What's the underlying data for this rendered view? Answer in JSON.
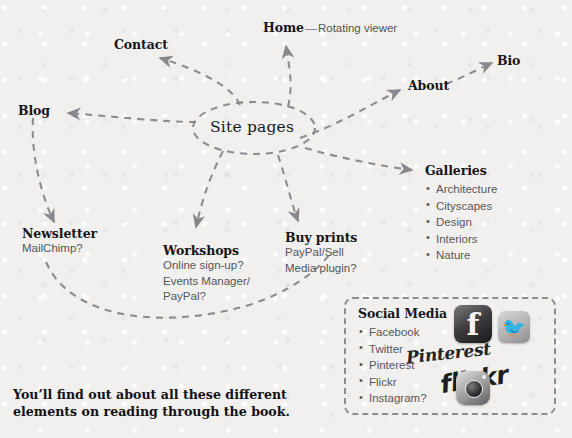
{
  "background_color": "#f1f0ee",
  "ink_color": "#16161a",
  "line_color": "#8d8d90",
  "center": {
    "label": "Site pages"
  },
  "nodes": {
    "contact": {
      "title": "Contact"
    },
    "blog": {
      "title": "Blog"
    },
    "home": {
      "title": "Home",
      "dash": "—",
      "note": "Rotating viewer"
    },
    "about": {
      "title": "About"
    },
    "bio": {
      "title": "Bio"
    },
    "galleries": {
      "title": "Galleries",
      "items": [
        "Architecture",
        "Cityscapes",
        "Design",
        "Interiors",
        "Nature"
      ]
    },
    "newsletter": {
      "title": "Newsletter",
      "lines": [
        "MailChimp?"
      ]
    },
    "workshops": {
      "title": "Workshops",
      "lines": [
        "Online sign-up?",
        "Events Manager/",
        "PayPal?"
      ]
    },
    "buy_prints": {
      "title": "Buy prints",
      "lines": [
        "PayPal/Sell",
        "Media plugin?"
      ]
    },
    "social_media": {
      "title": "Social Media",
      "items": [
        "Facebook",
        "Twitter",
        "Pinterest",
        "Flickr",
        "Instagram?"
      ],
      "logos": {
        "facebook_glyph": "f",
        "twitter_glyph": "ᵗ",
        "pinterest_wordmark": "Pinterest",
        "flickr_wordmark": "flickr"
      }
    }
  },
  "caption": {
    "line1": "You’ll find out about all these different",
    "line2": "elements on reading through the book."
  }
}
